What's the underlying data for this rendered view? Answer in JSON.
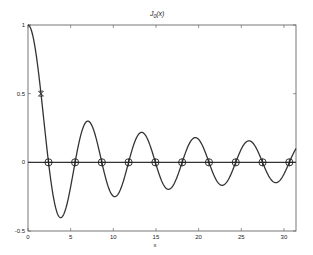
{
  "chart_data": {
    "type": "line",
    "title_main": "J",
    "title_sub": "0",
    "title_tail": "(x)",
    "xlabel": "x",
    "ylabel": "",
    "xlim": [
      0,
      31.4159
    ],
    "ylim": [
      -0.5,
      1
    ],
    "xticks": [
      0,
      5,
      10,
      15,
      20,
      25,
      30
    ],
    "xtick_labels": [
      "0",
      "5",
      "10",
      "15",
      "20",
      "25",
      "30"
    ],
    "yticks": [
      -0.5,
      0,
      0.5,
      1
    ],
    "ytick_labels": [
      "-0.5",
      "0",
      "0.5",
      "1"
    ],
    "grid": false,
    "series": [
      {
        "name": "J0(x)",
        "function": "besselj0",
        "color": "#333333"
      },
      {
        "name": "zero line",
        "values_constant": 0,
        "color": "#333333"
      }
    ],
    "zeros_marked": [
      2.405,
      5.52,
      8.654,
      11.792,
      14.931,
      18.071,
      21.212,
      24.352,
      27.493,
      30.635
    ],
    "zero_marker": "circle-plus",
    "special_point": {
      "x": 1.52,
      "y": 0.5,
      "marker": "x"
    },
    "sample_values": {
      "x": [
        0,
        2.405,
        3.83,
        7.02,
        10.17,
        13.32,
        16.47,
        19.62,
        22.76,
        25.9,
        29.05
      ],
      "y": [
        1,
        0,
        -0.403,
        0.3,
        -0.25,
        0.218,
        -0.196,
        0.18,
        -0.167,
        0.157,
        -0.148
      ]
    }
  }
}
